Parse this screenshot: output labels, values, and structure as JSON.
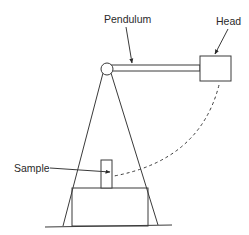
{
  "diagram": {
    "type": "pendulum impact tester schematic",
    "labels": {
      "pendulum": "Pendulum",
      "head": "Head",
      "sample": "Sample"
    },
    "colors": {
      "line": "#3a3a3a",
      "text": "#2a2a2a",
      "background": "#ffffff"
    },
    "components": [
      {
        "id": "pivot",
        "kind": "circle"
      },
      {
        "id": "pendulum-arm",
        "kind": "bar"
      },
      {
        "id": "head",
        "kind": "box"
      },
      {
        "id": "frame-legs",
        "kind": "a-frame"
      },
      {
        "id": "base",
        "kind": "box"
      },
      {
        "id": "sample",
        "kind": "box"
      },
      {
        "id": "swing-path",
        "kind": "dashed-arc"
      },
      {
        "id": "ground",
        "kind": "line"
      }
    ]
  }
}
